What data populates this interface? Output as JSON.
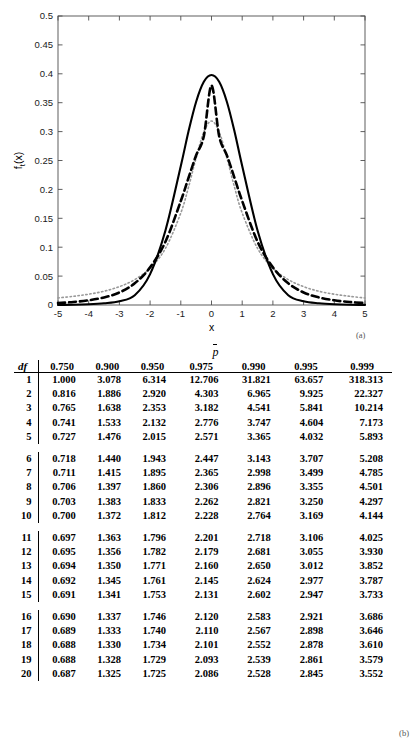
{
  "figure": {
    "panel_a_label": "(a)",
    "panel_b_label": "(b)"
  },
  "chart_data": [
    {
      "type": "line",
      "title": "",
      "xlabel": "x",
      "ylabel": "f_t(x)",
      "xlim": [
        -5,
        5
      ],
      "ylim": [
        0,
        0.5
      ],
      "xticks": [
        "-5",
        "-4",
        "-3",
        "-2",
        "-1",
        "0",
        "1",
        "2",
        "3",
        "4",
        "5"
      ],
      "yticks": [
        "0",
        "0.05",
        "0.1",
        "0.15",
        "0.2",
        "0.25",
        "0.3",
        "0.35",
        "0.4",
        "0.45",
        "0.5"
      ],
      "grid": false,
      "legend_position": "top-right",
      "series": [
        {
          "name": "k = 1",
          "style": "dotted",
          "color": "#999999",
          "peak": 0.3183,
          "x": [
            -5,
            -4.5,
            -4,
            -3.5,
            -3,
            -2.5,
            -2,
            -1.5,
            -1,
            -0.75,
            -0.5,
            -0.25,
            0,
            0.25,
            0.5,
            0.75,
            1,
            1.5,
            2,
            2.5,
            3,
            3.5,
            4,
            4.5,
            5
          ],
          "y": [
            0.0122,
            0.015,
            0.0187,
            0.0238,
            0.0318,
            0.0439,
            0.0637,
            0.0979,
            0.1592,
            0.2037,
            0.2546,
            0.2995,
            0.3183,
            0.2995,
            0.2546,
            0.2037,
            0.1592,
            0.0979,
            0.0637,
            0.0439,
            0.0318,
            0.0238,
            0.0187,
            0.015,
            0.0122
          ]
        },
        {
          "name": "k = 5",
          "style": "dashed",
          "color": "#000000",
          "peak": 0.3796,
          "x": [
            -5,
            -4.5,
            -4,
            -3.5,
            -3,
            -2.5,
            -2,
            -1.5,
            -1,
            -0.75,
            -0.5,
            -0.25,
            0,
            0.25,
            0.5,
            0.75,
            1,
            1.5,
            2,
            2.5,
            3,
            3.5,
            4,
            4.5,
            5
          ],
          "y": [
            0.0034,
            0.0052,
            0.0081,
            0.0131,
            0.0217,
            0.0375,
            0.0651,
            0.1095,
            0.1799,
            0.2197,
            0.2591,
            0.2921,
            0.3796,
            0.2921,
            0.2591,
            0.2197,
            0.1799,
            0.1095,
            0.0651,
            0.0375,
            0.0217,
            0.0131,
            0.0081,
            0.0052,
            0.0034
          ]
        },
        {
          "name": "k =100",
          "style": "solid",
          "color": "#000000",
          "peak": 0.3978,
          "x": [
            -5,
            -4.5,
            -4,
            -3.5,
            -3,
            -2.5,
            -2,
            -1.5,
            -1,
            -0.75,
            -0.5,
            -0.25,
            0,
            0.25,
            0.5,
            0.75,
            1,
            1.5,
            2,
            2.5,
            3,
            3.5,
            4,
            4.5,
            5
          ],
          "y": [
            0.0002,
            0.0005,
            0.0013,
            0.003,
            0.0065,
            0.017,
            0.0535,
            0.129,
            0.2405,
            0.3001,
            0.3517,
            0.3861,
            0.3978,
            0.3861,
            0.3517,
            0.3001,
            0.2405,
            0.129,
            0.0535,
            0.017,
            0.0065,
            0.003,
            0.0013,
            0.0005,
            0.0002
          ]
        }
      ]
    },
    {
      "type": "table",
      "title": "p̄",
      "header_symbol": "p",
      "df_label": "df",
      "columns": [
        "df",
        "0.750",
        "0.900",
        "0.950",
        "0.975",
        "0.990",
        "0.995",
        "0.999"
      ],
      "row_groups": [
        [
          [
            "1",
            "1.000",
            "3.078",
            "6.314",
            "12.706",
            "31.821",
            "63.657",
            "318.313"
          ],
          [
            "2",
            "0.816",
            "1.886",
            "2.920",
            "4.303",
            "6.965",
            "9.925",
            "22.327"
          ],
          [
            "3",
            "0.765",
            "1.638",
            "2.353",
            "3.182",
            "4.541",
            "5.841",
            "10.214"
          ],
          [
            "4",
            "0.741",
            "1.533",
            "2.132",
            "2.776",
            "3.747",
            "4.604",
            "7.173"
          ],
          [
            "5",
            "0.727",
            "1.476",
            "2.015",
            "2.571",
            "3.365",
            "4.032",
            "5.893"
          ]
        ],
        [
          [
            "6",
            "0.718",
            "1.440",
            "1.943",
            "2.447",
            "3.143",
            "3.707",
            "5.208"
          ],
          [
            "7",
            "0.711",
            "1.415",
            "1.895",
            "2.365",
            "2.998",
            "3.499",
            "4.785"
          ],
          [
            "8",
            "0.706",
            "1.397",
            "1.860",
            "2.306",
            "2.896",
            "3.355",
            "4.501"
          ],
          [
            "9",
            "0.703",
            "1.383",
            "1.833",
            "2.262",
            "2.821",
            "3.250",
            "4.297"
          ],
          [
            "10",
            "0.700",
            "1.372",
            "1.812",
            "2.228",
            "2.764",
            "3.169",
            "4.144"
          ]
        ],
        [
          [
            "11",
            "0.697",
            "1.363",
            "1.796",
            "2.201",
            "2.718",
            "3.106",
            "4.025"
          ],
          [
            "12",
            "0.695",
            "1.356",
            "1.782",
            "2.179",
            "2.681",
            "3.055",
            "3.930"
          ],
          [
            "13",
            "0.694",
            "1.350",
            "1.771",
            "2.160",
            "2.650",
            "3.012",
            "3.852"
          ],
          [
            "14",
            "0.692",
            "1.345",
            "1.761",
            "2.145",
            "2.624",
            "2.977",
            "3.787"
          ],
          [
            "15",
            "0.691",
            "1.341",
            "1.753",
            "2.131",
            "2.602",
            "2.947",
            "3.733"
          ]
        ],
        [
          [
            "16",
            "0.690",
            "1.337",
            "1.746",
            "2.120",
            "2.583",
            "2.921",
            "3.686"
          ],
          [
            "17",
            "0.689",
            "1.333",
            "1.740",
            "2.110",
            "2.567",
            "2.898",
            "3.646"
          ],
          [
            "18",
            "0.688",
            "1.330",
            "1.734",
            "2.101",
            "2.552",
            "2.878",
            "3.610"
          ],
          [
            "19",
            "0.688",
            "1.328",
            "1.729",
            "2.093",
            "2.539",
            "2.861",
            "3.579"
          ],
          [
            "20",
            "0.687",
            "1.325",
            "1.725",
            "2.086",
            "2.528",
            "2.845",
            "3.552"
          ]
        ]
      ]
    }
  ]
}
